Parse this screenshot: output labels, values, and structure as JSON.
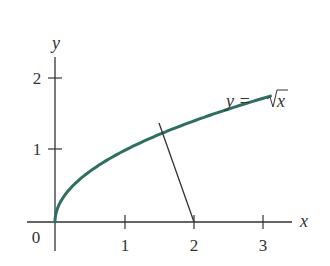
{
  "chart_data": {
    "type": "line",
    "title": "",
    "xlabel": "x",
    "ylabel": "y",
    "origin_label": "0",
    "x_ticks": [
      "1",
      "2",
      "3"
    ],
    "y_ticks": [
      "1",
      "2"
    ],
    "xlim": [
      0,
      3.4
    ],
    "ylim": [
      0,
      2.2
    ],
    "grid": false,
    "series": [
      {
        "name": "y = √x",
        "label_parts": {
          "lhs": "y =",
          "rhs": "x"
        },
        "color": "#2f6f62",
        "function": "sqrt(x)",
        "x_range": [
          0,
          3.1
        ]
      }
    ],
    "annotations": [
      {
        "type": "segment",
        "description": "line from point on curve to (2, 0)",
        "from": [
          1.5,
          1.22
        ],
        "to": [
          2,
          0
        ],
        "color": "#333333"
      }
    ]
  }
}
